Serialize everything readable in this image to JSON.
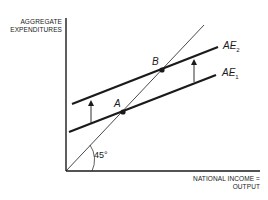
{
  "diagram": {
    "y_axis_label_line1": "AGGREGATE",
    "y_axis_label_line2": "EXPENDITURES",
    "x_axis_label_line1": "NATIONAL INCOME =",
    "x_axis_label_line2": "OUTPUT",
    "angle_label": "45°",
    "points": [
      {
        "label": "A"
      },
      {
        "label": "B"
      }
    ],
    "curves": [
      {
        "name": "AE",
        "subscript": "2"
      },
      {
        "name": "AE",
        "subscript": "1"
      }
    ],
    "colors": {
      "ink": "#1a1a1a",
      "background": "#ffffff"
    }
  }
}
